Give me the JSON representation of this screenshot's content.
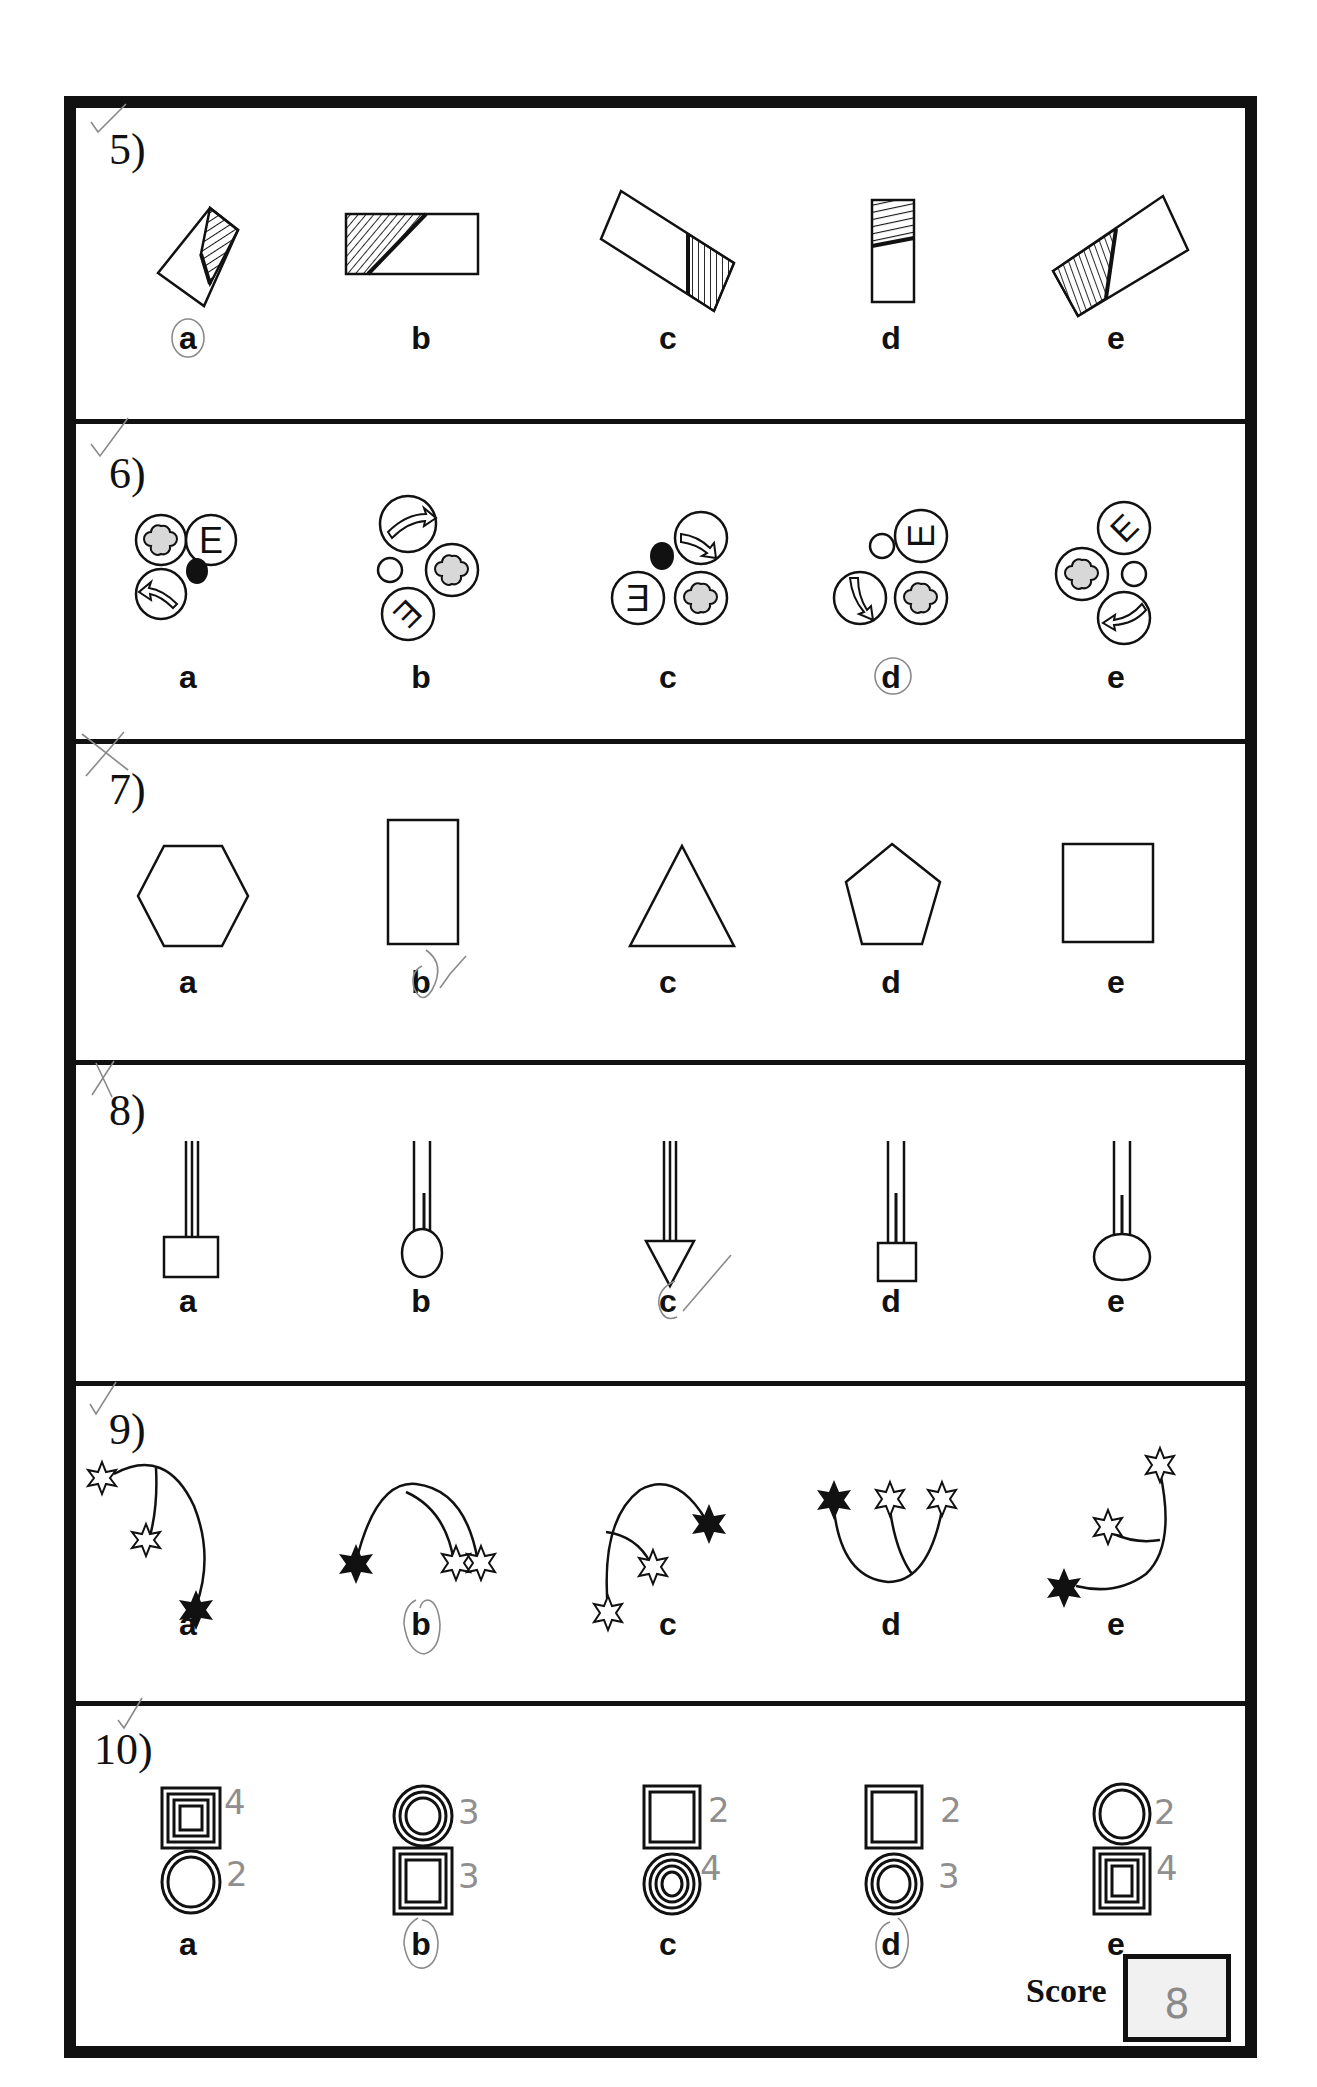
{
  "worksheet": {
    "questions": [
      {
        "number": "5)",
        "mark": "check",
        "options": [
          "a",
          "b",
          "c",
          "d",
          "e"
        ],
        "figures": [
          "tilted rectangle with hatched corner",
          "rectangle with hatched triangle",
          "tilted rectangle with vertical hatching",
          "narrow rectangle with hatched top",
          "tilted rectangle with diagonal hatching"
        ],
        "circled": "a"
      },
      {
        "number": "6)",
        "mark": "check",
        "options": [
          "a",
          "b",
          "c",
          "d",
          "e"
        ],
        "figures": [
          "cluster: clover, E, arrow, black dot",
          "cluster: arrow, clover, rotated E, white dot",
          "cluster: arrow, mirrored E, clover, black dot",
          "cluster: E rotated, arrow, clover, white dot",
          "cluster: clover, rotated E, arrow, white dot"
        ],
        "circled": "d"
      },
      {
        "number": "7)",
        "mark": "cross-check",
        "options": [
          "a",
          "b",
          "c",
          "d",
          "e"
        ],
        "figures": [
          "hexagon",
          "tall rectangle",
          "triangle",
          "pentagon",
          "square"
        ],
        "circled": "b"
      },
      {
        "number": "8)",
        "mark": "cross-check",
        "options": [
          "a",
          "b",
          "c",
          "d",
          "e"
        ],
        "figures": [
          "three lines with square",
          "two lines with inner line and oval",
          "three lines with triangle arrowhead",
          "two lines with inner line and small rectangle",
          "two lines with inner line and ellipse"
        ],
        "circled": "c"
      },
      {
        "number": "9)",
        "mark": "check",
        "options": [
          "a",
          "b",
          "c",
          "d",
          "e"
        ],
        "figures": [
          "arc with two white stars and black star",
          "arc with black star and two white stars",
          "arc with black star and two white stars",
          "U-curve with black star and two white stars",
          "arc with two white stars and black star"
        ],
        "circled": "b"
      },
      {
        "number": "10)",
        "mark": "check",
        "options": [
          "a",
          "b",
          "c",
          "d",
          "e"
        ],
        "annotations": [
          [
            "4",
            "2"
          ],
          [
            "3",
            "3"
          ],
          [
            "2",
            "4"
          ],
          [
            "2",
            "3"
          ],
          [
            "2",
            "4"
          ]
        ],
        "circled": [
          "b",
          "d"
        ]
      }
    ],
    "score": {
      "label": "Score",
      "value": "8"
    }
  }
}
